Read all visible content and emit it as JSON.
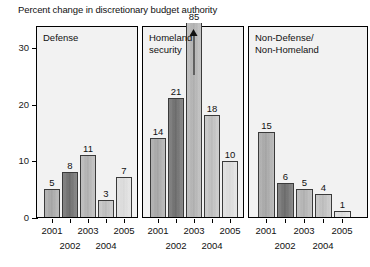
{
  "chart_data": {
    "type": "bar",
    "title": "Percent change in discretionary budget authority",
    "xlabel": "",
    "ylabel": "",
    "ylim": [
      0,
      34
    ],
    "yticks": [
      0,
      10,
      20,
      30
    ],
    "ytick_labels": [
      "0",
      "10",
      "20",
      "30"
    ],
    "grid": false,
    "legend": "none",
    "categories": [
      "2001",
      "2002",
      "2003",
      "2004",
      "2005"
    ],
    "panels": [
      {
        "label": "Defense",
        "values": [
          5,
          8,
          11,
          3,
          7
        ],
        "value_labels": [
          "5",
          "8",
          "11",
          "3",
          "7"
        ],
        "offscale_index": null
      },
      {
        "label": "Homeland\nsecurity",
        "values": [
          14,
          21,
          85,
          18,
          10
        ],
        "value_labels": [
          "14",
          "21",
          "85",
          "18",
          "10"
        ],
        "offscale_index": 2,
        "offscale_note": "bar extends beyond axis; arrow indicates value 85"
      },
      {
        "label": "Non-Defense/\nNon-Homeland",
        "values": [
          15,
          6,
          5,
          4,
          1
        ],
        "value_labels": [
          "15",
          "6",
          "5",
          "4",
          "1"
        ],
        "offscale_index": null
      }
    ],
    "series": [
      {
        "name": "Defense",
        "values": [
          5,
          8,
          11,
          3,
          7
        ]
      },
      {
        "name": "Homeland security",
        "values": [
          14,
          21,
          85,
          18,
          10
        ]
      },
      {
        "name": "Non-Defense/Non-Homeland",
        "values": [
          15,
          6,
          5,
          4,
          1
        ]
      }
    ],
    "colors": {
      "bar_2001": "#b0b0b0",
      "bar_2002": "#787878",
      "bar_2003": "#bcbcbc",
      "bar_2004": "#c8c8c8",
      "bar_2005": "#e2e2e2",
      "panel_background": "#f2f2f2",
      "axis": "#000000"
    }
  }
}
